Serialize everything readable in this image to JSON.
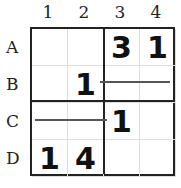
{
  "puzzle": {
    "columns": [
      "1",
      "2",
      "3",
      "4"
    ],
    "rows": [
      "A",
      "B",
      "C",
      "D"
    ],
    "cells": [
      [
        "",
        "",
        "3",
        "1"
      ],
      [
        "",
        "1",
        "",
        ""
      ],
      [
        "",
        "",
        "1",
        ""
      ],
      [
        "1",
        "4",
        "",
        ""
      ]
    ],
    "lines": [
      {
        "row": "B",
        "from_col": "2",
        "to_col": "4"
      },
      {
        "row": "C",
        "from_col": "1",
        "to_col": "3"
      }
    ],
    "colors": {
      "border": "#222222",
      "grid": "#dddddd",
      "digit": "#111111",
      "line": "#555555"
    }
  }
}
